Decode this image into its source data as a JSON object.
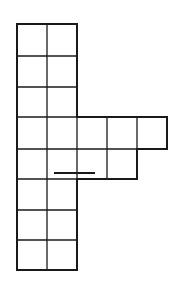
{
  "figure": {
    "cell_size_px": 30,
    "stroke_color": "#1a1a1a",
    "background": "#ffffff",
    "rows": [
      {
        "row": 1,
        "cells": 2,
        "y_top": 24
      },
      {
        "row": 2,
        "cells": 2,
        "y_top": 56
      },
      {
        "row": 3,
        "cells": 2,
        "y_top": 87
      },
      {
        "row": 4,
        "cells": 5,
        "y_top": 117
      },
      {
        "row": 5,
        "cells": 4,
        "y_top": 149
      },
      {
        "row": 6,
        "cells": 2,
        "y_top": 179
      },
      {
        "row": 7,
        "cells": 2,
        "y_top": 210
      },
      {
        "row": 8,
        "cells": 2,
        "y_top": 240
      }
    ],
    "total_cells": 21,
    "mark": {
      "type": "horizontal-dash",
      "x1": 54,
      "x2": 95,
      "y": 173
    }
  }
}
